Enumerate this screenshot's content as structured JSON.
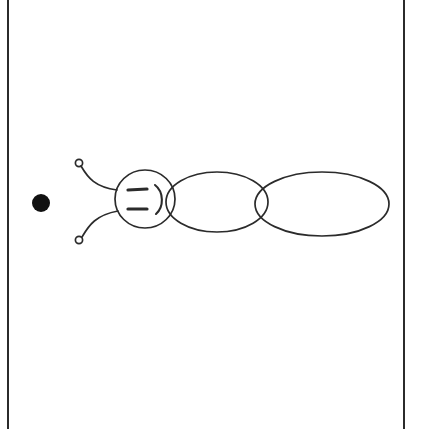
{
  "page": {
    "width": 425,
    "height": 429,
    "background_color": "#ffffff",
    "ink_color": "#2b2b2b",
    "fill_color": "#111111",
    "stroke_width": 1.7
  },
  "frame": {
    "name": "page-frame",
    "left_rule_x": 8,
    "right_rule_x": 404,
    "top_y": 0,
    "bottom_y": 429,
    "color": "#2b2b2b",
    "width": 2,
    "has_top_border": false,
    "has_bottom_border": false
  },
  "drawing": {
    "name": "bug-drawing",
    "shapes": [
      {
        "name": "black-dot",
        "kind": "circle-filled",
        "cx": 41,
        "cy": 203,
        "r": 9,
        "fill": "#111111"
      },
      {
        "name": "antenna-upper-stalk",
        "kind": "path",
        "d": "M 81 166 C 88 178 95 187 117 190",
        "stroke": "#2b2b2b"
      },
      {
        "name": "antenna-upper-tip",
        "kind": "circle-open",
        "cx": 79,
        "cy": 163,
        "r": 3.6,
        "stroke": "#2b2b2b"
      },
      {
        "name": "antenna-lower-stalk",
        "kind": "path",
        "d": "M 82 237 C 89 225 96 215 118 211",
        "stroke": "#2b2b2b"
      },
      {
        "name": "antenna-lower-tip",
        "kind": "circle-open",
        "cx": 79,
        "cy": 240,
        "r": 3.6,
        "stroke": "#2b2b2b"
      },
      {
        "name": "head-circle",
        "kind": "ellipse-open",
        "cx": 145,
        "cy": 199,
        "rx": 30,
        "ry": 29,
        "stroke": "#2b2b2b"
      },
      {
        "name": "eye-upper-bar",
        "kind": "path",
        "d": "M 128 190 L 147 189",
        "stroke": "#2b2b2b",
        "stroke_width": 3.2
      },
      {
        "name": "eye-lower-bar",
        "kind": "path",
        "d": "M 128 209 L 147 209",
        "stroke": "#2b2b2b",
        "stroke_width": 3.2
      },
      {
        "name": "mouth-arc",
        "kind": "path",
        "d": "M 155 185 C 164 192 164 207 156 214",
        "stroke": "#2b2b2b",
        "stroke_width": 2.1
      },
      {
        "name": "thorax-ellipse",
        "kind": "ellipse-open",
        "cx": 217,
        "cy": 202,
        "rx": 51,
        "ry": 30,
        "stroke": "#2b2b2b"
      },
      {
        "name": "abdomen-ellipse",
        "kind": "ellipse-open",
        "cx": 322,
        "cy": 204,
        "rx": 67,
        "ry": 32,
        "stroke": "#2b2b2b"
      }
    ],
    "face_expression": ":)"
  }
}
